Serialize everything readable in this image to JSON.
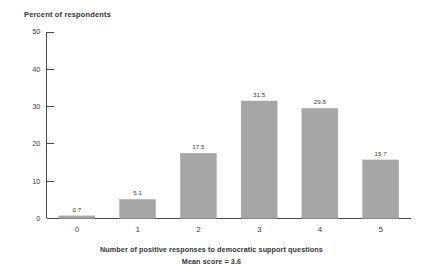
{
  "chart_data": {
    "type": "bar",
    "title": "Percent of respondents",
    "xlabel": "Number of positive responses to democratic support questions",
    "ylabel": "Percent of respondents",
    "annotation": "Mean score = 3.6",
    "categories": [
      "0",
      "1",
      "2",
      "3",
      "4",
      "5"
    ],
    "values": [
      0.7,
      5.1,
      17.5,
      31.5,
      29.5,
      15.7
    ],
    "value_labels": [
      "0.7",
      "5.1",
      "17.5",
      "31.5",
      "29.5",
      "15.7"
    ],
    "ylim": [
      0,
      50
    ],
    "yticks": [
      0,
      10,
      20,
      30,
      40,
      50
    ],
    "ytick_labels": [
      "0",
      "10",
      "20",
      "30",
      "40",
      "50"
    ],
    "grid": false,
    "legend": "none",
    "bar_color": "#a6a6a6",
    "axis_color": "#4a4a4a",
    "text_color": "#333333",
    "background": "#ffffff"
  },
  "labels": {
    "y_axis_title": "Percent of respondents",
    "x_axis_caption": "Number of positive responses to democratic support questions",
    "mean_caption": "Mean score = 3.6"
  }
}
